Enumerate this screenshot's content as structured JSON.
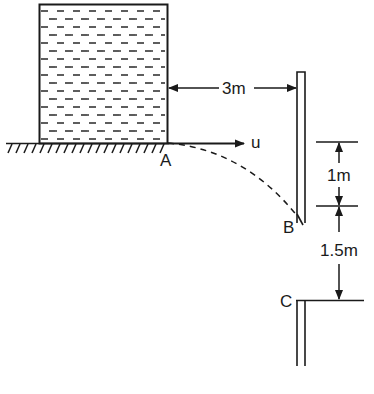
{
  "diagram": {
    "labels": {
      "point_a": "A",
      "point_b": "B",
      "point_c": "C",
      "velocity": "u",
      "horizontal_distance": "3m",
      "height_1": "1m",
      "height_2": "1.5m"
    },
    "stroke_color": "#1a1a1a",
    "background": "#ffffff"
  }
}
